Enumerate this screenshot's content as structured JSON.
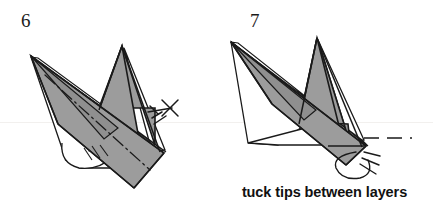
{
  "page": {
    "width": 433,
    "height": 210,
    "background": "#ffffff",
    "kind": "origami-instruction-diagram"
  },
  "colors": {
    "paper_shaded": "#9c9c9c",
    "paper_shaded_dark": "#8f8f8f",
    "paper_white": "#ffffff",
    "outline": "#1a1a1a",
    "text": "#111111",
    "scanline": "#f2f0ee"
  },
  "steps": [
    {
      "id": "step-6",
      "number": "6",
      "caption": "",
      "symbols": [
        {
          "name": "tuck-cross-symbol",
          "label": "x"
        },
        {
          "name": "mountain-fold-line",
          "label": "dash-dot fold line"
        },
        {
          "name": "layer-hatch-marks",
          "label": "layer edge hatching"
        }
      ]
    },
    {
      "id": "step-7",
      "number": "7",
      "caption": "tuck tips between layers",
      "symbols": [
        {
          "name": "tuck-curl-arrow",
          "label": "curl arrow"
        },
        {
          "name": "fold-reference-dashed-line",
          "label": "dashed reference line"
        }
      ]
    }
  ],
  "caption": {
    "text": "tuck tips between layers"
  }
}
